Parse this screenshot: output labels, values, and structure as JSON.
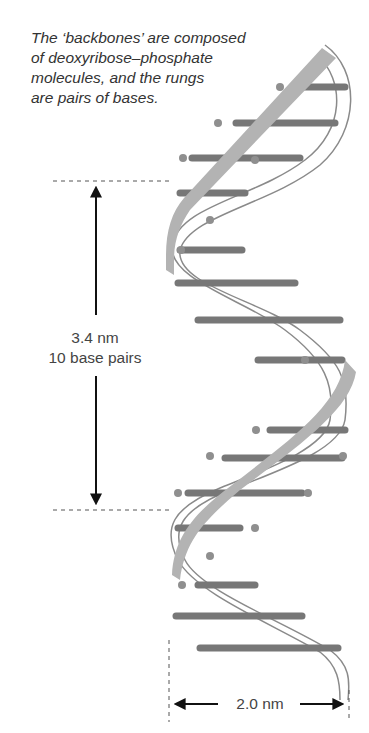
{
  "caption": {
    "line1": "The ‘backbones’ are composed",
    "line2": "of deoxyribose–phosphate",
    "line3": "molecules, and the rungs",
    "line4": "are pairs of bases."
  },
  "measurements": {
    "pitch": {
      "value": "3.4 nm",
      "sub": "10 base pairs"
    },
    "width": {
      "value": "2.0 nm"
    }
  },
  "colors": {
    "backbone_front": "#b3b3b3",
    "backbone_back_outline": "#8a8a8a",
    "rung": "#777777",
    "phosphate_dot": "#8f8f8f",
    "arrow": "#111111",
    "dash": "#555555"
  }
}
